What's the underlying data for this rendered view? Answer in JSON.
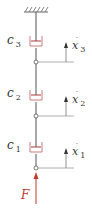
{
  "diagram": {
    "ground": {
      "type": "fixed-support-hatch"
    },
    "dampers": [
      {
        "id": "c3",
        "symbol": "c",
        "subscript": "3"
      },
      {
        "id": "c2",
        "symbol": "c",
        "subscript": "2"
      },
      {
        "id": "c1",
        "symbol": "c",
        "subscript": "1"
      }
    ],
    "velocities": [
      {
        "id": "x3dot",
        "symbol": "x",
        "dot": "˙",
        "subscript": "3"
      },
      {
        "id": "x2dot",
        "symbol": "x",
        "dot": "˙",
        "subscript": "2"
      },
      {
        "id": "x1dot",
        "symbol": "x",
        "dot": "˙",
        "subscript": "1"
      }
    ],
    "force": {
      "symbol": "F",
      "color": "#c0392b"
    },
    "colors": {
      "line": "#555555",
      "damper": "#c0392b",
      "force": "#c0392b",
      "ground": "#666666"
    }
  }
}
